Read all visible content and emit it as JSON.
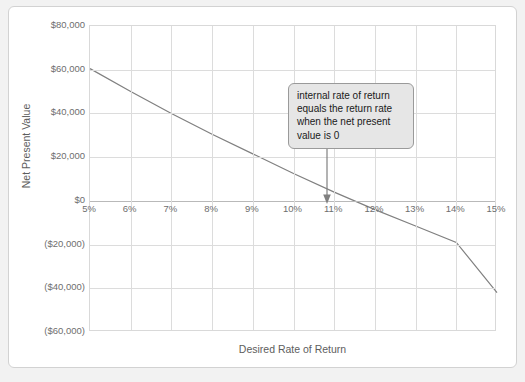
{
  "chart_data": {
    "type": "line",
    "title": "",
    "xlabel": "Desired Rate of Return",
    "ylabel": "Net Present Value",
    "xlim": [
      5,
      15
    ],
    "ylim": [
      -60000,
      80000
    ],
    "grid": true,
    "legend": "none",
    "x_tick_labels": [
      "5%",
      "6%",
      "7%",
      "8%",
      "9%",
      "10%",
      "11%",
      "12%",
      "13%",
      "14%",
      "15%"
    ],
    "x_tick_values": [
      5,
      6,
      7,
      8,
      9,
      10,
      11,
      12,
      13,
      14,
      15
    ],
    "y_tick_labels": [
      "$80,000",
      "$60,000",
      "$40,000",
      "$20,000",
      "$0",
      "($20,000)",
      "($40,000)",
      "($60,000)"
    ],
    "y_tick_values": [
      80000,
      60000,
      40000,
      20000,
      0,
      -20000,
      -40000,
      -60000
    ],
    "series": [
      {
        "name": "Net Present Value",
        "color": "#808080",
        "x": [
          5,
          6,
          7,
          8,
          9,
          10,
          11,
          12,
          13,
          14,
          15
        ],
        "values": [
          60500,
          50000,
          40000,
          30500,
          21500,
          12500,
          4000,
          -4000,
          -11500,
          -19000,
          -42000
        ]
      }
    ],
    "annotations": [
      {
        "text": "internal rate of return equals the return rate when the net present value is 0",
        "points_to_x": 10.7,
        "points_to_y": 0
      }
    ]
  },
  "colors": {
    "page_background": "#f2f2f2",
    "card_background": "#ffffff",
    "card_border": "#d2d2d2",
    "gridline": "#dcdcdc",
    "series_line": "#808080",
    "tick_text": "#6e6e6e",
    "axis_title_text": "#5d5d5d",
    "callout_fill": "#e6e6e6",
    "callout_border": "#9a9a9a",
    "arrow": "#808080"
  }
}
